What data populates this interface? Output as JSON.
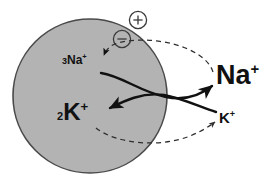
{
  "diagram": {
    "type": "biology-schematic",
    "canvas": {
      "width": 272,
      "height": 184
    },
    "colors": {
      "background": "#ffffff",
      "cell_fill": "#b3b3b3",
      "cell_stroke": "#4a4a4a",
      "ink": "#111111",
      "dashed_stroke": "#3a3a3a"
    },
    "cell": {
      "name": "cell-interior",
      "shape": "circle",
      "cx": 90,
      "cy": 96,
      "r": 77
    },
    "charge_markers": [
      {
        "name": "plus-charge-symbol",
        "symbol": "+",
        "label": "positive charge",
        "cx": 138,
        "cy": 20,
        "r": 9
      },
      {
        "name": "minus-charge-symbol",
        "symbol": "−",
        "label": "negative charge",
        "cx": 122,
        "cy": 39,
        "r": 9
      }
    ],
    "labels": {
      "sodium_inside": {
        "count": "3",
        "ion": "Na",
        "charge": "+"
      },
      "potassium_inside": {
        "count": "2",
        "ion": "K",
        "charge": "+"
      },
      "sodium_outside": {
        "count": "",
        "ion": "Na",
        "charge": "+"
      },
      "potassium_outside": {
        "count": "",
        "ion": "K",
        "charge": "+"
      }
    },
    "arrows": [
      {
        "name": "sodium-efflux-arrow",
        "style": "solid",
        "from": "3 Na+ (inside)",
        "to": "Na+ (outside)",
        "direction": "outward"
      },
      {
        "name": "potassium-influx-arrow",
        "style": "solid",
        "from": "K+ (outside)",
        "to": "2 K+ (inside)",
        "direction": "inward"
      },
      {
        "name": "sodium-leak-dashed-arrow",
        "style": "dashed",
        "from": "Na+ (outside)",
        "to": "3 Na+ (inside)",
        "direction": "inward"
      },
      {
        "name": "potassium-leak-dashed-arrow",
        "style": "dashed",
        "from": "2 K+ (inside)",
        "to": "K+ (outside)",
        "direction": "outward"
      }
    ]
  }
}
